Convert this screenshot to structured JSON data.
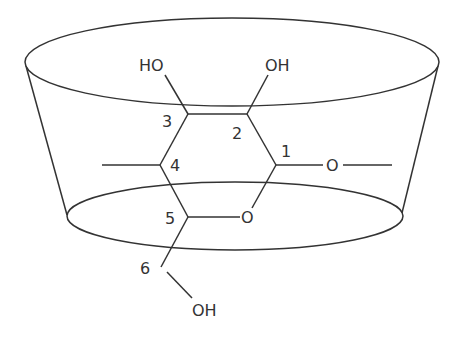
{
  "diagram": {
    "stroke_color": "#333333",
    "background": "#ffffff",
    "labels": {
      "ho_c3": "HO",
      "oh_c2": "OH",
      "oh_c6": "OH",
      "ring_oxygen": "O",
      "glycosidic_oxygen": "O",
      "c1": "1",
      "c2": "2",
      "c3": "3",
      "c4": "4",
      "c5": "5",
      "c6": "6"
    }
  }
}
